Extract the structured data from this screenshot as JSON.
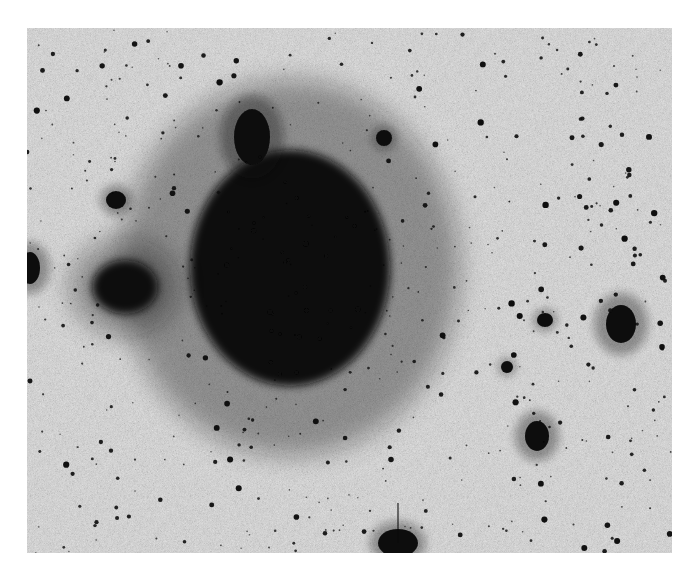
{
  "image": {
    "kind": "negative astronomical photographic plate",
    "canvas": {
      "width": 695,
      "height": 580,
      "background": "#ffffff"
    },
    "plate": {
      "x": 27,
      "y": 28,
      "width": 645,
      "height": 525,
      "sky_color": "#c9c9c9",
      "ink_color": "#0a0a0a"
    }
  },
  "objects": [
    {
      "name": "main-galaxy",
      "cx": 290,
      "cy": 268,
      "rx": 100,
      "ry": 118,
      "halo": 70
    },
    {
      "name": "galaxy-northern-lobe",
      "cx": 252,
      "cy": 137,
      "rx": 18,
      "ry": 28,
      "halo": 14
    },
    {
      "name": "left-companion-galaxy",
      "cx": 125,
      "cy": 287,
      "rx": 33,
      "ry": 27,
      "halo": 22
    },
    {
      "name": "left-edge-galaxy",
      "cx": 30,
      "cy": 268,
      "rx": 10,
      "ry": 16,
      "halo": 10
    },
    {
      "name": "right-galaxy-upper",
      "cx": 621,
      "cy": 324,
      "rx": 15,
      "ry": 19,
      "halo": 12
    },
    {
      "name": "right-galaxy-lower",
      "cx": 537,
      "cy": 436,
      "rx": 12,
      "ry": 15,
      "halo": 10
    },
    {
      "name": "bright-star-bottom",
      "cx": 398,
      "cy": 543,
      "rx": 20,
      "ry": 14,
      "halo": 8,
      "spike": true
    },
    {
      "name": "star-diamond",
      "cx": 384,
      "cy": 138,
      "rx": 8,
      "ry": 8,
      "halo": 4
    },
    {
      "name": "star-left-upper",
      "cx": 116,
      "cy": 200,
      "rx": 10,
      "ry": 9,
      "halo": 6
    },
    {
      "name": "star-right-mid",
      "cx": 545,
      "cy": 320,
      "rx": 8,
      "ry": 7,
      "halo": 4
    },
    {
      "name": "star-right-mid2",
      "cx": 507,
      "cy": 367,
      "rx": 6,
      "ry": 6,
      "halo": 3
    }
  ],
  "star_field": {
    "count": 520,
    "seed": 17,
    "min_r": 0.8,
    "max_r": 3.2
  }
}
